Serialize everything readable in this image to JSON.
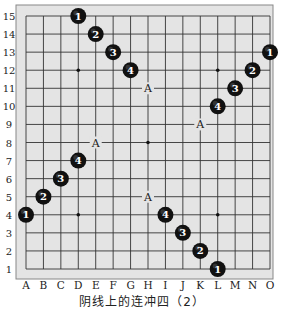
{
  "title": "阴线上的连冲四（2）",
  "board": {
    "size": 15,
    "columns": [
      "A",
      "B",
      "C",
      "D",
      "E",
      "F",
      "G",
      "H",
      "I",
      "J",
      "K",
      "L",
      "M",
      "N",
      "O"
    ],
    "rows": [
      15,
      14,
      13,
      12,
      11,
      10,
      9,
      8,
      7,
      6,
      5,
      4,
      3,
      2,
      1
    ],
    "colors": {
      "background": "#e4e4e4",
      "frame": "#888888",
      "line": "#333333",
      "stone": "#111111",
      "stone_text": "#ffffff"
    },
    "star_points": [
      "D12",
      "L12",
      "H8",
      "D4",
      "L4"
    ],
    "stones": [
      {
        "pos": "D15",
        "label": "1"
      },
      {
        "pos": "E14",
        "label": "2"
      },
      {
        "pos": "F13",
        "label": "3"
      },
      {
        "pos": "G12",
        "label": "4"
      },
      {
        "pos": "O13",
        "label": "1"
      },
      {
        "pos": "N12",
        "label": "2"
      },
      {
        "pos": "M11",
        "label": "3"
      },
      {
        "pos": "L10",
        "label": "4"
      },
      {
        "pos": "A4",
        "label": "1"
      },
      {
        "pos": "B5",
        "label": "2"
      },
      {
        "pos": "C6",
        "label": "3"
      },
      {
        "pos": "D7",
        "label": "4"
      },
      {
        "pos": "L1",
        "label": "1"
      },
      {
        "pos": "K2",
        "label": "2"
      },
      {
        "pos": "J3",
        "label": "3"
      },
      {
        "pos": "I4",
        "label": "4"
      }
    ],
    "markers": [
      {
        "pos": "H11",
        "label": "A"
      },
      {
        "pos": "K9",
        "label": "A"
      },
      {
        "pos": "E8",
        "label": "A"
      },
      {
        "pos": "H5",
        "label": "A"
      }
    ]
  }
}
